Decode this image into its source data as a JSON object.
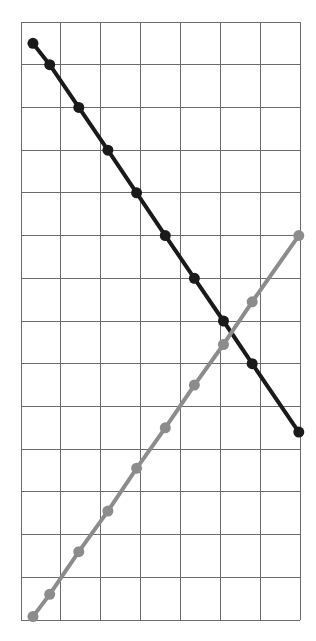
{
  "chart_data": {
    "type": "line",
    "title": "",
    "subtitle": "",
    "xlabel": "",
    "ylabel": "",
    "grid": true,
    "grid_columns": 7,
    "grid_rows": 14,
    "xlim": [
      0,
      7
    ],
    "ylim": [
      0,
      14
    ],
    "xticks": [
      0,
      1,
      2,
      3,
      4,
      5,
      6,
      7
    ],
    "yticks": [
      0,
      1,
      2,
      3,
      4,
      5,
      6,
      7,
      8,
      9,
      10,
      11,
      12,
      13,
      14
    ],
    "xtick_labels": [],
    "ytick_labels": [],
    "legend": [],
    "legend_position": "none",
    "annotations": [],
    "series": [
      {
        "name": "descending-series",
        "color": "#1a1a1a",
        "line_width": 4,
        "marker": "circle",
        "marker_size": 11,
        "x": [
          0.3,
          0.72,
          1.45,
          2.18,
          2.9,
          3.62,
          4.35,
          5.08,
          5.8,
          6.97
        ],
        "y": [
          13.5,
          13.0,
          12.0,
          11.0,
          10.0,
          9.0,
          8.0,
          7.0,
          6.0,
          4.4
        ]
      },
      {
        "name": "ascending-series",
        "color": "#8c8c8c",
        "line_width": 4,
        "marker": "circle",
        "marker_size": 11,
        "x": [
          0.3,
          0.72,
          1.45,
          2.18,
          2.9,
          3.62,
          4.35,
          5.08,
          5.8,
          6.97
        ],
        "y": [
          0.08,
          0.6,
          1.6,
          2.55,
          3.55,
          4.5,
          5.5,
          6.45,
          7.45,
          9.0
        ]
      }
    ],
    "grid_color": "#6b6b6b",
    "background_color": "#ffffff",
    "plot_left": 21,
    "plot_top": 22,
    "plot_right": 300,
    "plot_bottom": 620
  }
}
